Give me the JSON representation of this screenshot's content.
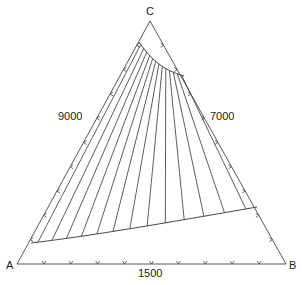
{
  "diagram": {
    "type": "ternary-phase-diagram",
    "vertices": {
      "top": "C",
      "left": "A",
      "right": "B"
    },
    "edge_labels": {
      "left": "9000",
      "right": "7000",
      "bottom": "1500"
    },
    "tick_counts": {
      "left": 9,
      "right": 9,
      "bottom": 9
    },
    "tie_line_count": 13,
    "line_color": "#333333"
  }
}
